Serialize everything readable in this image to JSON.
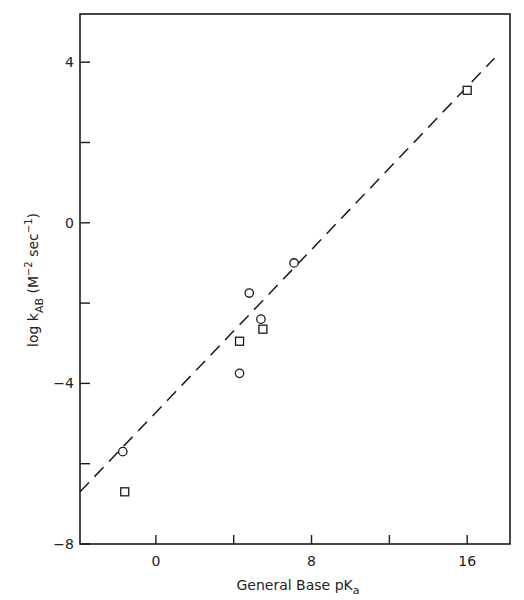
{
  "chart_data": {
    "type": "scatter",
    "title": "",
    "xlabel": "General Base pK_a",
    "ylabel": "log k_AB (M^-2 sec^-1)",
    "xlabel_parts": {
      "main": "General Base pK",
      "sub": "a"
    },
    "ylabel_parts": {
      "main": "log k",
      "sub": "AB",
      "unit_open": " (M",
      "unit_exp1": "−2",
      "unit_mid": " sec",
      "unit_exp2": "−1",
      "unit_close": ")"
    },
    "xlim": [
      -3.9,
      18.2
    ],
    "ylim": [
      -8,
      5.2
    ],
    "x_ticks": [
      0,
      4,
      8,
      12,
      16
    ],
    "x_tick_labels": [
      "0",
      "",
      "8",
      "",
      "16"
    ],
    "y_ticks": [
      -8,
      -6,
      -4,
      -2,
      0,
      2,
      4
    ],
    "y_tick_labels": [
      "−8",
      "",
      "−4",
      "",
      "0",
      "",
      "4"
    ],
    "grid": false,
    "legend": null,
    "series": [
      {
        "name": "circles",
        "marker": "circle",
        "points": [
          {
            "x": -1.7,
            "y": -5.7
          },
          {
            "x": 4.3,
            "y": -3.75
          },
          {
            "x": 4.8,
            "y": -1.75
          },
          {
            "x": 5.4,
            "y": -2.4
          },
          {
            "x": 7.1,
            "y": -1.0
          }
        ]
      },
      {
        "name": "squares",
        "marker": "square",
        "points": [
          {
            "x": -1.6,
            "y": -6.7
          },
          {
            "x": 4.3,
            "y": -2.95
          },
          {
            "x": 5.5,
            "y": -2.65
          },
          {
            "x": 16.0,
            "y": 3.3
          }
        ]
      },
      {
        "name": "fit line",
        "marker": "dashed-line",
        "points": [
          {
            "x": -3.9,
            "y": -6.7
          },
          {
            "x": 17.4,
            "y": 4.1
          }
        ]
      }
    ]
  }
}
